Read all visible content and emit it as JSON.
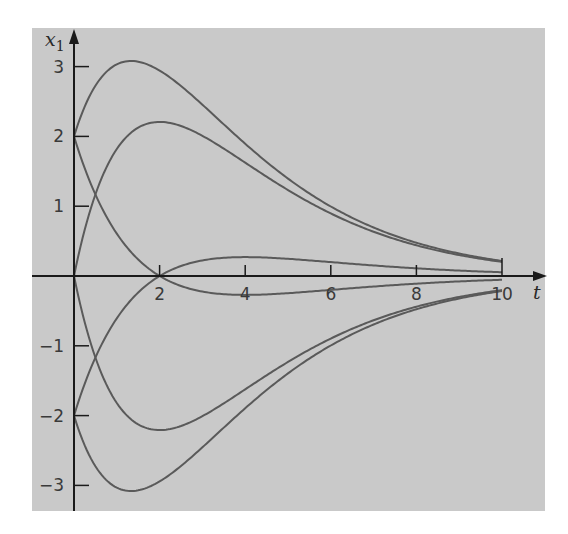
{
  "chart_data": {
    "type": "line",
    "title": "",
    "xlabel": "t",
    "ylabel": "x1",
    "ylabel_main": "x",
    "ylabel_sub": "1",
    "xlim": [
      0,
      10
    ],
    "ylim": [
      -3.2,
      3.2
    ],
    "x_ticks": [
      2,
      4,
      6,
      8,
      10
    ],
    "x_tick_labels": [
      "2",
      "4",
      "6",
      "8",
      "10"
    ],
    "y_ticks": [
      3,
      2,
      1,
      -1,
      -2,
      -3
    ],
    "y_tick_labels": [
      "3",
      "2",
      "1",
      "−1",
      "−2",
      "−3"
    ],
    "grid": false,
    "legend": null,
    "background_color": "#c9c9c9",
    "line_color": "#5a5a5a",
    "axis_color": "#1a1a1a",
    "series": [
      {
        "name": "x1 = (2 + 3t)e^(-t/2)",
        "c1": 2,
        "c2": 3,
        "points": [
          [
            0,
            2.0
          ],
          [
            1,
            3.03
          ],
          [
            1.33,
            3.08
          ],
          [
            2,
            2.94
          ],
          [
            4,
            1.89
          ],
          [
            6,
            0.99
          ],
          [
            8,
            0.48
          ],
          [
            10,
            0.22
          ]
        ]
      },
      {
        "name": "x1 = 3t e^(-t/2)",
        "c1": 0,
        "c2": 3,
        "points": [
          [
            0,
            0.0
          ],
          [
            1,
            1.82
          ],
          [
            2,
            2.21
          ],
          [
            4,
            1.62
          ],
          [
            6,
            0.9
          ],
          [
            8,
            0.44
          ],
          [
            10,
            0.2
          ]
        ]
      },
      {
        "name": "x1 = (2 - t)e^(-t/2)",
        "c1": 2,
        "c2": -1,
        "points": [
          [
            0,
            2.0
          ],
          [
            1,
            0.61
          ],
          [
            2,
            0.0
          ],
          [
            4,
            -0.27
          ],
          [
            6,
            -0.2
          ],
          [
            8,
            -0.11
          ],
          [
            10,
            -0.05
          ]
        ]
      },
      {
        "name": "x1 = (t - 2)e^(-t/2)",
        "c1": -2,
        "c2": 1,
        "points": [
          [
            0,
            -2.0
          ],
          [
            1,
            -0.61
          ],
          [
            2,
            0.0
          ],
          [
            4,
            0.27
          ],
          [
            6,
            0.2
          ],
          [
            8,
            0.11
          ],
          [
            10,
            0.05
          ]
        ]
      },
      {
        "name": "x1 = -3t e^(-t/2)",
        "c1": 0,
        "c2": -3,
        "points": [
          [
            0,
            0.0
          ],
          [
            1,
            -1.82
          ],
          [
            2,
            -2.21
          ],
          [
            4,
            -1.62
          ],
          [
            6,
            -0.9
          ],
          [
            8,
            -0.44
          ],
          [
            10,
            -0.2
          ]
        ]
      },
      {
        "name": "x1 = -(2 + 3t)e^(-t/2)",
        "c1": -2,
        "c2": -3,
        "points": [
          [
            0,
            -2.0
          ],
          [
            1,
            -3.03
          ],
          [
            1.33,
            -3.08
          ],
          [
            2,
            -2.94
          ],
          [
            4,
            -1.89
          ],
          [
            6,
            -0.99
          ],
          [
            8,
            -0.48
          ],
          [
            10,
            -0.22
          ]
        ]
      }
    ]
  }
}
